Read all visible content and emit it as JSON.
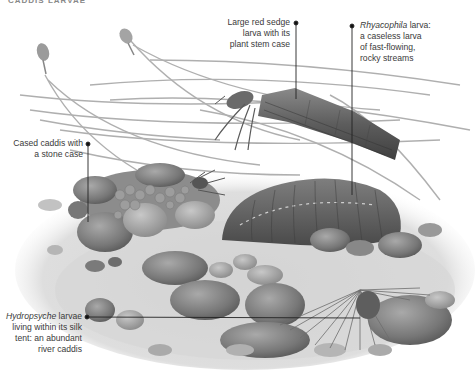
{
  "title": "CADDIS LARVAE",
  "labels": {
    "red_sedge": {
      "line1": "Large red sedge",
      "line2": "larva with its",
      "line3": "plant stem case"
    },
    "rhyacophila": {
      "italic": "Rhyacophila",
      "line1_rest": " larva:",
      "line2": "a caseless larva",
      "line3": "of fast-flowing,",
      "line4": "rocky streams"
    },
    "cased_caddis": {
      "line1": "Cased caddis with",
      "line2": "a stone case"
    },
    "hydropsyche": {
      "italic": "Hydropsyche",
      "line1_rest": " larvae",
      "line2": "living within its silk",
      "line3": "tent: an abundant",
      "line4": "river caddis"
    }
  },
  "palette": {
    "ink": "#3a3a3a",
    "pointer": "#222222",
    "stone_dark": "#6e6e6e",
    "stone_mid": "#8f8f8f",
    "stone_light": "#b5b5b5",
    "gravel": "#cfcfcf",
    "weed": "#9a9a9a"
  }
}
